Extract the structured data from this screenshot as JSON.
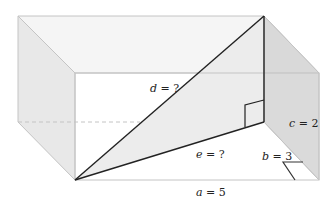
{
  "diagram": {
    "type": "rectangular-prism-space-diagonal",
    "labels": {
      "d": {
        "var": "d",
        "eq": " = ?"
      },
      "e": {
        "var": "e",
        "eq": " = ?"
      },
      "a": {
        "var": "a",
        "eq": " = 5"
      },
      "b": {
        "var": "b",
        "eq": " = 3"
      },
      "c": {
        "var": "c",
        "eq": " = 2"
      }
    },
    "colors": {
      "edge": "#bdbdbd",
      "face_side": "#e6e6e6",
      "face_right": "#d6d6d6",
      "face_top": "#f4f4f4",
      "triangle": "#ececec",
      "line": "#222222"
    }
  }
}
